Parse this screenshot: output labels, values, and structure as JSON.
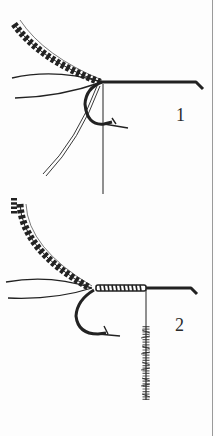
{
  "figure": {
    "steps": [
      {
        "number": "1",
        "description": "Hook with tail fibers and barred feather tied in, thread hanging"
      },
      {
        "number": "2",
        "description": "Thread wrapped along shank, chenille hanging from thread"
      }
    ]
  },
  "colors": {
    "ink": "#222222",
    "paper": "#fdfdfd",
    "edge": "#9a9a9a"
  }
}
